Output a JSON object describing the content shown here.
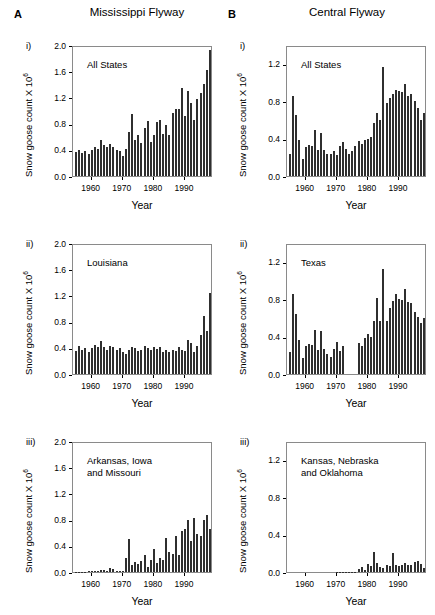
{
  "figure": {
    "columns": [
      {
        "letter": "A",
        "title": "Mississippi Flyway"
      },
      {
        "letter": "B",
        "title": "Central Flyway"
      }
    ],
    "axis_titles": {
      "x": "Year",
      "y_prefix": "Snow goose count X 10",
      "y_exponent": "6"
    },
    "panel_numerals": [
      "i)",
      "ii)",
      "iii)"
    ],
    "bar_color": "#2f2f2f",
    "frame_color": "#8a8a8a"
  },
  "chart_data": [
    {
      "id": "A-i",
      "type": "bar",
      "panel_letter": "A",
      "numeral": "i)",
      "column_title": "Mississippi Flyway",
      "annotation": "All States",
      "title": "",
      "xlabel": "Year",
      "ylabel": "Snow goose count X 10^6",
      "ylim": [
        0.0,
        2.0
      ],
      "yticks": [
        0.0,
        0.4,
        0.8,
        1.2,
        1.6,
        2.0
      ],
      "ytick_labels": [
        "0.0",
        "0.4",
        "0.8",
        "1.2",
        "1.6",
        "2.0"
      ],
      "xlim": [
        1954,
        1999
      ],
      "xticks": [
        1960,
        1970,
        1980,
        1990
      ],
      "xtick_labels": [
        "1960",
        "1970",
        "1980",
        "1990"
      ],
      "grid": false,
      "x": [
        1955,
        1956,
        1957,
        1958,
        1959,
        1960,
        1961,
        1962,
        1963,
        1964,
        1965,
        1966,
        1967,
        1968,
        1969,
        1970,
        1971,
        1972,
        1973,
        1974,
        1975,
        1976,
        1977,
        1978,
        1979,
        1980,
        1981,
        1982,
        1983,
        1984,
        1985,
        1986,
        1987,
        1988,
        1989,
        1990,
        1991,
        1992,
        1993,
        1994,
        1995,
        1996,
        1997,
        1998
      ],
      "values": [
        0.36,
        0.4,
        0.35,
        0.38,
        0.34,
        0.4,
        0.45,
        0.42,
        0.55,
        0.47,
        0.44,
        0.49,
        0.44,
        0.4,
        0.38,
        0.3,
        0.42,
        0.67,
        0.94,
        0.55,
        0.63,
        0.5,
        0.73,
        0.84,
        0.52,
        0.62,
        0.82,
        0.86,
        0.64,
        0.78,
        0.63,
        0.96,
        1.02,
        1.02,
        1.35,
        0.92,
        1.3,
        1.11,
        0.85,
        1.18,
        1.27,
        1.4,
        1.62,
        1.92
      ]
    },
    {
      "id": "A-ii",
      "type": "bar",
      "panel_letter": "A",
      "numeral": "ii)",
      "annotation": "Louisiana",
      "title": "",
      "xlabel": "Year",
      "ylabel": "Snow goose count X 10^6",
      "ylim": [
        0.0,
        2.0
      ],
      "yticks": [
        0.0,
        0.4,
        0.8,
        1.2,
        1.6,
        2.0
      ],
      "ytick_labels": [
        "0.0",
        "0.4",
        "0.8",
        "1.2",
        "1.6",
        "2.0"
      ],
      "xlim": [
        1954,
        1999
      ],
      "xticks": [
        1960,
        1970,
        1980,
        1990
      ],
      "xtick_labels": [
        "1960",
        "1970",
        "1980",
        "1990"
      ],
      "grid": false,
      "x": [
        1955,
        1956,
        1957,
        1958,
        1959,
        1960,
        1961,
        1962,
        1963,
        1964,
        1965,
        1966,
        1967,
        1968,
        1969,
        1970,
        1971,
        1972,
        1973,
        1974,
        1975,
        1976,
        1977,
        1978,
        1979,
        1980,
        1981,
        1982,
        1983,
        1984,
        1985,
        1986,
        1987,
        1988,
        1989,
        1990,
        1991,
        1992,
        1993,
        1994,
        1995,
        1996,
        1997,
        1998
      ],
      "values": [
        0.35,
        0.43,
        0.36,
        0.4,
        0.34,
        0.39,
        0.44,
        0.41,
        0.51,
        0.42,
        0.36,
        0.43,
        0.41,
        0.37,
        0.39,
        0.33,
        0.3,
        0.36,
        0.41,
        0.39,
        0.35,
        0.37,
        0.43,
        0.4,
        0.36,
        0.42,
        0.38,
        0.41,
        0.34,
        0.36,
        0.33,
        0.37,
        0.35,
        0.41,
        0.36,
        0.35,
        0.52,
        0.47,
        0.33,
        0.43,
        0.6,
        0.89,
        0.66,
        1.24
      ]
    },
    {
      "id": "A-iii",
      "type": "bar",
      "panel_letter": "A",
      "numeral": "iii)",
      "annotation": "Arkansas, Iowa\nand Missouri",
      "title": "",
      "xlabel": "Year",
      "ylabel": "Snow goose count X 10^6",
      "ylim": [
        0.0,
        2.0
      ],
      "yticks": [
        0.0,
        0.4,
        0.8,
        1.2,
        1.6,
        2.0
      ],
      "ytick_labels": [
        "0.0",
        "0.4",
        "0.8",
        "1.2",
        "1.6",
        "2.0"
      ],
      "xlim": [
        1954,
        1999
      ],
      "xticks": [
        1960,
        1970,
        1980,
        1990
      ],
      "xtick_labels": [
        "1960",
        "1970",
        "1980",
        "1990"
      ],
      "grid": false,
      "x": [
        1955,
        1956,
        1957,
        1958,
        1959,
        1960,
        1961,
        1962,
        1963,
        1964,
        1965,
        1966,
        1967,
        1968,
        1969,
        1970,
        1971,
        1972,
        1973,
        1974,
        1975,
        1976,
        1977,
        1978,
        1979,
        1980,
        1981,
        1982,
        1983,
        1984,
        1985,
        1986,
        1987,
        1988,
        1989,
        1990,
        1991,
        1992,
        1993,
        1994,
        1995,
        1996,
        1997,
        1998
      ],
      "values": [
        0.005,
        0.004,
        0.006,
        0.005,
        0.008,
        0.01,
        0.012,
        0.01,
        0.03,
        0.028,
        0.02,
        0.06,
        0.045,
        0.015,
        0.01,
        0.012,
        0.21,
        0.51,
        0.1,
        0.16,
        0.12,
        0.17,
        0.26,
        0.07,
        0.19,
        0.35,
        0.14,
        0.21,
        0.18,
        0.52,
        0.3,
        0.27,
        0.55,
        0.26,
        0.63,
        0.65,
        0.8,
        0.47,
        0.83,
        0.58,
        0.55,
        0.79,
        0.87,
        0.66
      ]
    },
    {
      "id": "B-i",
      "type": "bar",
      "panel_letter": "B",
      "numeral": "i)",
      "column_title": "Central Flyway",
      "annotation": "All States",
      "title": "",
      "xlabel": "Year",
      "ylabel": "Snow goose count X 10^6",
      "ylim": [
        0.0,
        1.4
      ],
      "yticks": [
        0.0,
        0.4,
        0.8,
        1.2
      ],
      "ytick_labels": [
        "0.0",
        "0.4",
        "0.8",
        "1.2"
      ],
      "xlim": [
        1954,
        1999
      ],
      "xticks": [
        1960,
        1970,
        1980,
        1990
      ],
      "xtick_labels": [
        "1960",
        "1970",
        "1980",
        "1990"
      ],
      "grid": false,
      "x": [
        1955,
        1956,
        1957,
        1958,
        1959,
        1960,
        1961,
        1962,
        1963,
        1964,
        1965,
        1966,
        1967,
        1968,
        1969,
        1970,
        1971,
        1972,
        1973,
        1974,
        1975,
        1976,
        1977,
        1978,
        1979,
        1980,
        1981,
        1982,
        1983,
        1984,
        1985,
        1986,
        1987,
        1988,
        1989,
        1990,
        1991,
        1992,
        1993,
        1994,
        1995,
        1996,
        1997,
        1998
      ],
      "values": [
        0.23,
        0.86,
        0.65,
        0.39,
        0.18,
        0.31,
        0.33,
        0.32,
        0.49,
        0.28,
        0.46,
        0.28,
        0.23,
        0.24,
        0.27,
        0.22,
        0.32,
        0.36,
        0.29,
        0.23,
        0.27,
        0.32,
        0.37,
        0.34,
        0.39,
        0.4,
        0.42,
        0.57,
        0.67,
        0.6,
        1.17,
        0.78,
        0.83,
        0.88,
        0.92,
        0.91,
        0.9,
        0.98,
        0.85,
        0.88,
        0.8,
        0.73,
        0.6,
        0.67
      ]
    },
    {
      "id": "B-ii",
      "type": "bar",
      "panel_letter": "B",
      "numeral": "ii)",
      "annotation": "Texas",
      "title": "",
      "xlabel": "Year",
      "ylabel": "Snow goose count X 10^6",
      "ylim": [
        0.0,
        1.4
      ],
      "yticks": [
        0.0,
        0.4,
        0.8,
        1.2
      ],
      "ytick_labels": [
        "0.0",
        "0.4",
        "0.8",
        "1.2"
      ],
      "xlim": [
        1954,
        1999
      ],
      "xticks": [
        1960,
        1970,
        1980,
        1990
      ],
      "xtick_labels": [
        "1960",
        "1970",
        "1980",
        "1990"
      ],
      "grid": false,
      "note": "no data 1973-1976",
      "x": [
        1955,
        1956,
        1957,
        1958,
        1959,
        1960,
        1961,
        1962,
        1963,
        1964,
        1965,
        1966,
        1967,
        1968,
        1969,
        1970,
        1971,
        1972,
        1973,
        1974,
        1975,
        1976,
        1977,
        1978,
        1979,
        1980,
        1981,
        1982,
        1983,
        1984,
        1985,
        1986,
        1987,
        1988,
        1989,
        1990,
        1991,
        1992,
        1993,
        1994,
        1995,
        1996,
        1997,
        1998
      ],
      "values": [
        0.23,
        0.86,
        0.64,
        0.36,
        0.17,
        0.3,
        0.32,
        0.31,
        0.47,
        0.26,
        0.46,
        0.27,
        0.21,
        0.18,
        0.27,
        0.34,
        0.25,
        0.3,
        null,
        null,
        null,
        null,
        0.33,
        0.3,
        0.39,
        0.43,
        0.4,
        0.57,
        0.81,
        0.57,
        1.12,
        0.57,
        0.71,
        0.78,
        0.85,
        0.8,
        0.79,
        0.91,
        0.77,
        0.76,
        0.66,
        0.61,
        0.55,
        0.6
      ]
    },
    {
      "id": "B-iii",
      "type": "bar",
      "panel_letter": "B",
      "numeral": "iii)",
      "annotation": "Kansas, Nebraska\nand Oklahoma",
      "title": "",
      "xlabel": "Year",
      "ylabel": "Snow goose count X 10^6",
      "ylim": [
        0.0,
        1.4
      ],
      "yticks": [
        0.0,
        0.4,
        0.8,
        1.2
      ],
      "ytick_labels": [
        "0.0",
        "0.4",
        "0.8",
        "1.2"
      ],
      "xlim": [
        1954,
        1999
      ],
      "xticks": [
        1960,
        1970,
        1980,
        1990
      ],
      "xtick_labels": [
        "1960",
        "1970",
        "1980",
        "1990"
      ],
      "grid": false,
      "x": [
        1955,
        1956,
        1957,
        1958,
        1959,
        1960,
        1961,
        1962,
        1963,
        1964,
        1965,
        1966,
        1967,
        1968,
        1969,
        1970,
        1971,
        1972,
        1973,
        1974,
        1975,
        1976,
        1977,
        1978,
        1979,
        1980,
        1981,
        1982,
        1983,
        1984,
        1985,
        1986,
        1987,
        1988,
        1989,
        1990,
        1991,
        1992,
        1993,
        1994,
        1995,
        1996,
        1997,
        1998
      ],
      "values": [
        0,
        0,
        0,
        0,
        0,
        0,
        0,
        0,
        0,
        0,
        0,
        0,
        0,
        0,
        0,
        0.002,
        0.002,
        0.002,
        0.002,
        0.002,
        0.002,
        0.002,
        0.03,
        0.05,
        0.02,
        0.09,
        0.06,
        0.21,
        0.1,
        0.05,
        0.04,
        0.08,
        0.06,
        0.2,
        0.07,
        0.06,
        0.08,
        0.1,
        0.07,
        0.08,
        0.11,
        0.12,
        0.09,
        0.04
      ]
    }
  ]
}
